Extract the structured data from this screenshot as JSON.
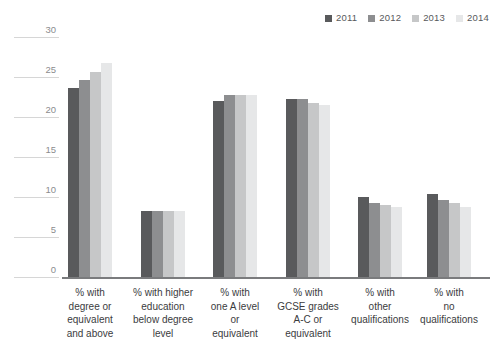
{
  "title_remnant": "",
  "legend": {
    "position": "top-right",
    "items": [
      {
        "label": "2011",
        "color": "#595a5c"
      },
      {
        "label": "2012",
        "color": "#8d8e90"
      },
      {
        "label": "2013",
        "color": "#c6c7c8"
      },
      {
        "label": "2014",
        "color": "#e6e7e8"
      }
    ]
  },
  "chart_data": {
    "type": "bar",
    "title": "",
    "subtitle": "",
    "xlabel": "",
    "ylabel": "",
    "ylim": [
      0,
      30
    ],
    "yticks": [
      0,
      5,
      10,
      15,
      20,
      25,
      30
    ],
    "ytick_labels": [
      "0",
      "5",
      "10",
      "15",
      "20",
      "25",
      "30"
    ],
    "grid": true,
    "legend_position": "top-right",
    "categories": [
      "% with\ndegree or\nequivalent\nand above",
      "% with higher\neducation\nbelow degree\nlevel",
      "% with\none A level\nor\nequivalent",
      "% with\nGCSE grades\nA-C or\nequivalent",
      "% with\nother\nqualifications",
      "% with\nno\nqualifications"
    ],
    "series": [
      {
        "name": "2011",
        "color": "#595a5c",
        "values": [
          23.6,
          8.2,
          22.0,
          22.3,
          10.0,
          10.4
        ]
      },
      {
        "name": "2012",
        "color": "#8d8e90",
        "values": [
          24.6,
          8.3,
          22.7,
          22.2,
          9.2,
          9.6
        ]
      },
      {
        "name": "2013",
        "color": "#c6c7c8",
        "values": [
          25.6,
          8.3,
          22.7,
          21.8,
          9.0,
          9.2
        ]
      },
      {
        "name": "2014",
        "color": "#e6e7e8",
        "values": [
          26.7,
          8.3,
          22.7,
          21.5,
          8.7,
          8.7
        ]
      }
    ]
  }
}
